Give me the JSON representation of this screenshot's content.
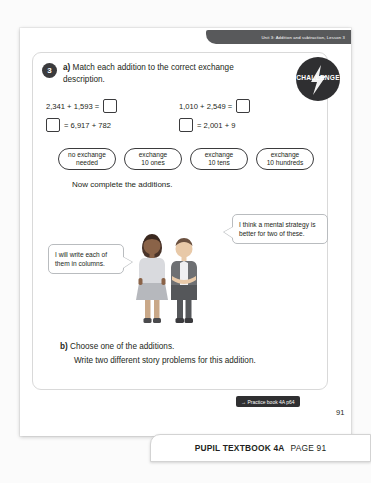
{
  "unit_banner": "Unit 3: Addition and subtraction, Lesson 3",
  "challenge_badge": "CHALLENGE",
  "question": {
    "number": "3",
    "part_a_label": "a)",
    "part_a_text": "Match each addition to the correct exchange description.",
    "equations": [
      {
        "text": "2,341 + 1,593 =",
        "box_position": "after"
      },
      {
        "text": "1,010 + 2,549 =",
        "box_position": "after"
      },
      {
        "text": "= 6,917 + 782",
        "box_position": "before"
      },
      {
        "text": "= 2,001 + 9",
        "box_position": "before"
      }
    ],
    "options": [
      {
        "line1": "no exchange",
        "line2": "needed"
      },
      {
        "line1": "exchange",
        "line2": "10 ones"
      },
      {
        "line1": "exchange",
        "line2": "10 tens"
      },
      {
        "line1": "exchange",
        "line2": "10 hundreds"
      }
    ],
    "now_complete": "Now complete the additions.",
    "part_b_label": "b)",
    "part_b_line1": "Choose one of the additions.",
    "part_b_line2": "Write two different story problems for this addition."
  },
  "speech": {
    "left": "I will write each of them in columns.",
    "right": "I think a mental strategy is better for two of these."
  },
  "practice_tag": "→ Practice book 4A p64",
  "page_number": "91",
  "footer": {
    "title": "PUPIL TEXTBOOK 4A",
    "page": "PAGE 91"
  },
  "colors": {
    "banner": "#58595b",
    "badge": "#2f2f31",
    "ink": "#231f20"
  }
}
